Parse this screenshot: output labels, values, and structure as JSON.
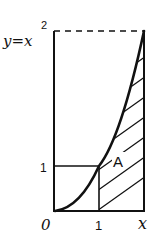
{
  "diagram": {
    "curve_label": "y=x",
    "curve_exponent": "2",
    "region_label": "A",
    "y_tick_label": "1",
    "x_axis_labels": {
      "origin": "0",
      "one": "1",
      "end": "x"
    },
    "colors": {
      "ink": "#111111",
      "background": "#ffffff"
    }
  }
}
